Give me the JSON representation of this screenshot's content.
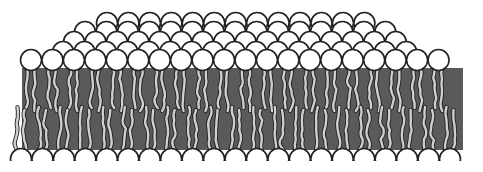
{
  "diagram": {
    "colors": {
      "background": "#ffffff",
      "head_fill": "#ffffff",
      "outline": "#222222",
      "core": "#5a5a5a",
      "tail_fill": "#cfcfcf"
    },
    "front_row": {
      "count": 20,
      "x_start": 31,
      "spacing": 21.45,
      "y": 60,
      "r": 10.5
    },
    "back_rows": [
      {
        "count": 17,
        "x_start": 63,
        "spacing": 21.45,
        "y": 52,
        "r": 10.5
      },
      {
        "count": 16,
        "x_start": 74,
        "spacing": 21.45,
        "y": 42,
        "r": 10.5
      },
      {
        "count": 15,
        "x_start": 85,
        "spacing": 21.45,
        "y": 32,
        "r": 10.5
      },
      {
        "count": 13,
        "x_start": 107,
        "spacing": 21.45,
        "y": 23,
        "r": 10.5
      }
    ],
    "core": {
      "x": 22,
      "y": 68,
      "width": 441,
      "height": 82
    },
    "bottom_row": {
      "count": 21,
      "x_start": 31,
      "spacing": 21.45,
      "y": 159,
      "r": 10.5
    }
  }
}
